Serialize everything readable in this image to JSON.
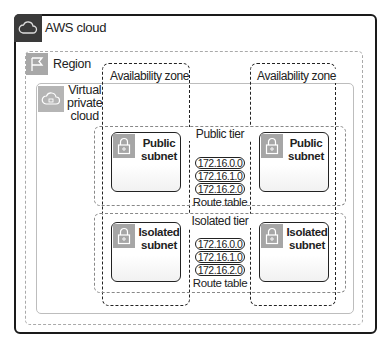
{
  "diagram": {
    "aws_cloud": {
      "label": "AWS cloud",
      "icon": "cloud-icon"
    },
    "region": {
      "label": "Region",
      "icon": "flag-icon"
    },
    "vpc": {
      "label_lines": [
        "Virtual",
        "private",
        "cloud"
      ],
      "icon": "cloud-lock-icon"
    },
    "availability_zones": [
      {
        "label": "Availability zone"
      },
      {
        "label": "Availability zone"
      }
    ],
    "tiers": [
      {
        "label": "Public tier",
        "subnets": [
          {
            "label_lines": [
              "Public",
              "subnet"
            ],
            "icon": "lock-icon"
          },
          {
            "label_lines": [
              "Public",
              "subnet"
            ],
            "icon": "lock-icon"
          }
        ],
        "route_table": {
          "entries": [
            "172.16.0.0",
            "172.16.1.0",
            "172.16.2.0"
          ],
          "label": "Route table"
        }
      },
      {
        "label": "Isolated tier",
        "subnets": [
          {
            "label_lines": [
              "Isolated",
              "subnet"
            ],
            "icon": "lock-icon"
          },
          {
            "label_lines": [
              "Isolated",
              "subnet"
            ],
            "icon": "lock-icon"
          }
        ],
        "route_table": {
          "entries": [
            "172.16.0.0",
            "172.16.1.0",
            "172.16.2.0"
          ],
          "label": "Route table"
        }
      }
    ]
  },
  "colors": {
    "aws_border": "#1a1a1a",
    "aws_icon_bg": "#3a3a3a",
    "region_border": "#aaaaaa",
    "vpc_border": "#bdbdbd",
    "icon_gray": "#a8a8a8"
  }
}
